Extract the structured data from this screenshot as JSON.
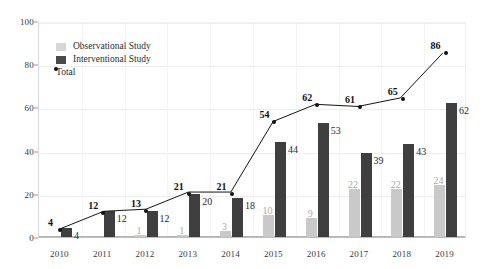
{
  "chart_data": {
    "type": "bar",
    "title": "",
    "subtitle": "",
    "xlabel": "",
    "ylabel": "",
    "categories": [
      "2010",
      "2011",
      "2012",
      "2013",
      "2014",
      "2015",
      "2016",
      "2017",
      "2018",
      "2019"
    ],
    "series": [
      {
        "name": "Observational Study",
        "kind": "bar",
        "color": "#c9c9c9",
        "values": [
          0,
          0,
          1,
          1,
          3,
          10,
          9,
          22,
          22,
          24
        ],
        "labels": [
          "",
          "",
          "1",
          "1",
          "3",
          "10",
          "9",
          "22",
          "22",
          "24"
        ]
      },
      {
        "name": "Interventional Study",
        "kind": "bar",
        "color": "#3f3f3f",
        "values": [
          4,
          12,
          12,
          20,
          18,
          44,
          53,
          39,
          43,
          62
        ],
        "labels": [
          "4",
          "12",
          "12",
          "20",
          "18",
          "44",
          "53",
          "39",
          "43",
          "62"
        ]
      },
      {
        "name": "Total",
        "kind": "line",
        "color": "#111111",
        "values": [
          4,
          12,
          13,
          21,
          21,
          54,
          62,
          61,
          65,
          86
        ],
        "labels": [
          "4",
          "12",
          "13",
          "21",
          "21",
          "54",
          "62",
          "61",
          "65",
          "86"
        ]
      }
    ],
    "ylim": [
      0,
      100
    ],
    "yticks": [
      0,
      20,
      40,
      60,
      80,
      100
    ],
    "ytick_labels": [
      "0",
      "20",
      "40",
      "60",
      "80",
      "100"
    ],
    "grid": true,
    "legend_position": "top-left",
    "legend": [
      "Observational Study",
      "Interventional Study",
      "Total"
    ]
  },
  "colors": {
    "observational": "#c9c9c9",
    "interventional": "#3f3f3f",
    "total": "#111111",
    "grid": "#ededed",
    "axis": "#b5b5b5",
    "background": "#ffffff"
  }
}
